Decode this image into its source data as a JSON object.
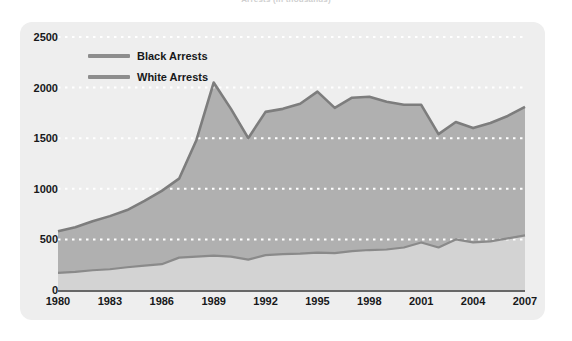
{
  "figure": {
    "clipped_title": "Arrests (in thousands)"
  },
  "legend": {
    "position": "top-left-inside",
    "items": [
      {
        "label": "Black Arrests",
        "color": "#8d8d8d"
      },
      {
        "label": "White Arrests",
        "color": "#8d8d8d"
      }
    ]
  },
  "colors": {
    "panel_background": "#eeeeee",
    "black_arrests_fill": "#b0b0b0",
    "black_arrests_line": "#7d7d7d",
    "white_arrests_fill": "#d3d3d3",
    "white_arrests_line": "#8a8a8a",
    "gridline": "#ffffff",
    "text": "#17181a"
  },
  "chart_data": {
    "type": "area",
    "title": "Arrests (in thousands)",
    "xlabel": "",
    "ylabel": "",
    "xlim": [
      1980,
      2007
    ],
    "ylim": [
      0,
      2500
    ],
    "grid": true,
    "gridline_style": "dotted-white-horizontal",
    "legend_position": "top-left-inside",
    "ytick_labels": [
      "0",
      "500",
      "1000",
      "1500",
      "2000",
      "2500"
    ],
    "ytick_values": [
      0,
      500,
      1000,
      1500,
      2000,
      2500
    ],
    "xtick_labels": [
      "1980",
      "1983",
      "1986",
      "1989",
      "1992",
      "1995",
      "1998",
      "2001",
      "2004",
      "2007"
    ],
    "xtick_values": [
      1980,
      1983,
      1986,
      1989,
      1992,
      1995,
      1998,
      2001,
      2004,
      2007
    ],
    "x": [
      1980,
      1981,
      1982,
      1983,
      1984,
      1985,
      1986,
      1987,
      1988,
      1989,
      1990,
      1991,
      1992,
      1993,
      1994,
      1995,
      1996,
      1997,
      1998,
      1999,
      2000,
      2001,
      2002,
      2003,
      2004,
      2005,
      2006,
      2007
    ],
    "series": [
      {
        "name": "Black Arrests",
        "color": "#b0b0b0",
        "line_color": "#7d7d7d",
        "values": [
          580,
          620,
          680,
          730,
          790,
          880,
          980,
          1100,
          1480,
          2050,
          1790,
          1500,
          1760,
          1790,
          1840,
          1960,
          1800,
          1900,
          1910,
          1860,
          1830,
          1830,
          1540,
          1660,
          1600,
          1650,
          1720,
          1810
        ]
      },
      {
        "name": "White Arrests",
        "color": "#d3d3d3",
        "line_color": "#8a8a8a",
        "values": [
          170,
          180,
          195,
          205,
          225,
          240,
          255,
          320,
          330,
          340,
          330,
          300,
          345,
          355,
          360,
          370,
          365,
          385,
          395,
          400,
          420,
          470,
          420,
          500,
          470,
          480,
          510,
          540
        ]
      }
    ]
  }
}
